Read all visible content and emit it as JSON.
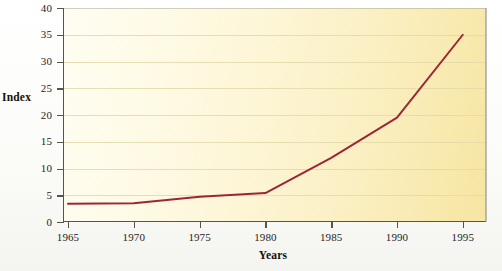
{
  "chart_data": {
    "type": "line",
    "title": "",
    "xlabel": "Years",
    "ylabel": "Index",
    "x": [
      1965,
      1970,
      1975,
      1980,
      1985,
      1990,
      1995
    ],
    "xticks": [
      "1965",
      "1970",
      "1975",
      "1980",
      "1985",
      "1990",
      "1995"
    ],
    "yticks": [
      "0",
      "5",
      "10",
      "15",
      "20",
      "25",
      "30",
      "35",
      "40"
    ],
    "ytick_values": [
      0,
      5,
      10,
      15,
      20,
      25,
      30,
      35,
      40
    ],
    "xlim": [
      1965,
      1997
    ],
    "ylim": [
      0,
      40
    ],
    "grid": true,
    "legend": false,
    "series": [
      {
        "name": "Index",
        "color": "#9c2636",
        "values": [
          3.4,
          3.5,
          4.7,
          5.4,
          12.0,
          19.5,
          35.0
        ]
      }
    ],
    "plot_background_color": "#fbf2cb",
    "gridline_color": "#e2d9a8",
    "axis_color": "#56544e"
  },
  "axis": {
    "y_title": "Index",
    "x_title": "Years"
  }
}
